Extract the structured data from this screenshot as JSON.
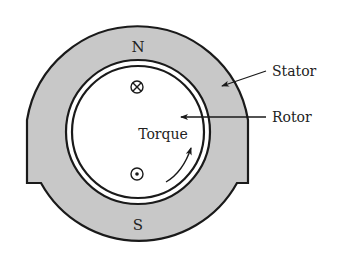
{
  "diagram": {
    "type": "dc-motor-cross-section",
    "poles": {
      "north": "N",
      "south": "S"
    },
    "labels": {
      "stator": "Stator",
      "rotor": "Rotor",
      "torque": "Torque"
    },
    "conductors": {
      "top": {
        "symbol": "⊗",
        "meaning": "current into page"
      },
      "bottom": {
        "symbol": "⊙",
        "meaning": "current out of page"
      }
    },
    "colors": {
      "stator_fill": "#c8c8c8",
      "outline": "#1a1a1a",
      "rotor_fill": "#ffffff",
      "background": "#ffffff"
    }
  }
}
